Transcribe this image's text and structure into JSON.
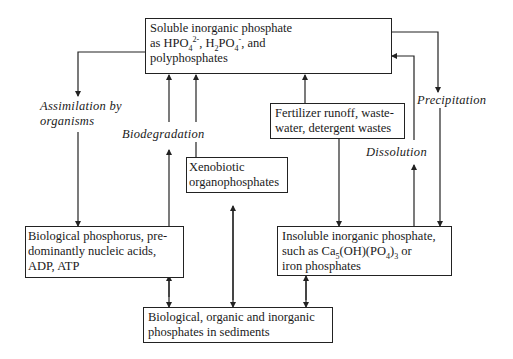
{
  "nodes": {
    "soluble": {
      "line1": "Soluble inorganic phosphate",
      "line2_prefix": "as HPO",
      "line2_sub1": "4",
      "line2_sup1": "2-",
      "line2_mid": ", H",
      "line2_sub2": "2",
      "line2_mid2": "PO",
      "line2_sub3": "4",
      "line2_sup2": "-",
      "line2_suffix": ", and",
      "line3": "polyphosphates"
    },
    "fertilizer": {
      "line1": "Fertilizer runoff, waste-",
      "line2": "water, detergent wastes"
    },
    "xenobiotic": {
      "line1": "Xenobiotic",
      "line2": "organophosphates"
    },
    "biological": {
      "line1": "Biological phosphorus, pre-",
      "line2": "dominantly nucleic acids,",
      "line3": "ADP, ATP"
    },
    "insoluble": {
      "line1": "Insoluble inorganic phosphate,",
      "line2_prefix": "such as Ca",
      "line2_sub1": "5",
      "line2_mid": "(OH)(PO",
      "line2_sub2": "4",
      "line2_close": ")",
      "line2_sub3": "3",
      "line2_suffix": " or",
      "line3": "iron phosphates"
    },
    "sediments": {
      "line1": "Biological, organic and inorganic",
      "line2": "phosphates in sediments"
    }
  },
  "process_labels": {
    "assimilation_line1": "Assimilation by",
    "assimilation_line2": "organisms",
    "biodegradation": "Biodegradation",
    "precipitation": "Precipitation",
    "dissolution": "Dissolution"
  },
  "colors": {
    "line": "#222222",
    "background": "#ffffff"
  }
}
